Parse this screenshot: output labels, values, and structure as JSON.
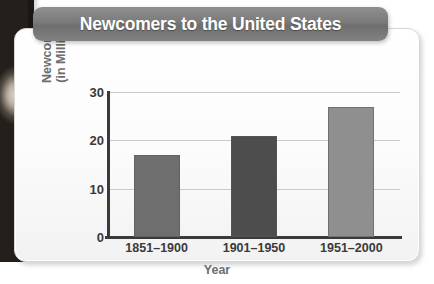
{
  "chart_data": {
    "type": "bar",
    "title": "Newcomers to the United States",
    "xlabel": "Year",
    "ylabel_line1": "Newcomers",
    "ylabel_line2": "(in Millions)",
    "ylabel": "Newcomers (in Millions)",
    "categories": [
      "1851–1900",
      "1901–1950",
      "1951–2000"
    ],
    "values": [
      17,
      21,
      27
    ],
    "ylim": [
      0,
      30
    ],
    "yticks": [
      "0",
      "10",
      "20",
      "30"
    ],
    "ytick_values": [
      0,
      10,
      20,
      30
    ],
    "grid": true,
    "legend": "none",
    "bar_colors": [
      "#6e6e6e",
      "#4d4d4d",
      "#8f8f8f"
    ],
    "series": [
      {
        "name": "Newcomers",
        "values": [
          17,
          21,
          27
        ]
      }
    ]
  },
  "style": {
    "title_banner_color": "#7a7a7a",
    "title_text_color": "#ffffff",
    "axis_color": "#3a3a3a",
    "grid_color": "#c9c9c9",
    "label_color": "#6d6d6d",
    "card_background": "#fdfdfd"
  }
}
